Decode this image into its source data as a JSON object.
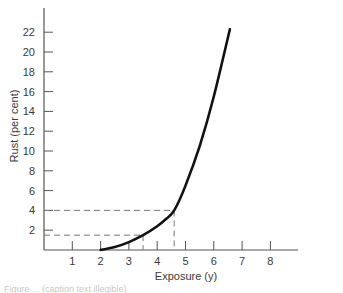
{
  "chart_data": {
    "type": "line",
    "title": "",
    "xlabel": "Exposure (y)",
    "ylabel": "Rust (per cent)",
    "xlim": [
      0,
      9
    ],
    "ylim": [
      0,
      24
    ],
    "x_ticks": [
      1,
      2,
      3,
      4,
      5,
      6,
      7,
      8
    ],
    "y_ticks": [
      2,
      4,
      6,
      8,
      10,
      12,
      14,
      16,
      18,
      20,
      22
    ],
    "grid": false,
    "legend": null,
    "series": [
      {
        "name": "Rust vs exposure",
        "x": [
          2.0,
          2.5,
          3.0,
          3.5,
          4.0,
          4.3,
          4.6,
          5.0,
          5.5,
          6.0,
          6.57
        ],
        "y": [
          0.0,
          0.3,
          0.8,
          1.5,
          2.4,
          3.1,
          4.0,
          6.5,
          10.5,
          15.5,
          22.3
        ]
      }
    ],
    "annotations": [
      {
        "type": "dashed-guide",
        "x": 3.5,
        "y": 1.5
      },
      {
        "type": "dashed-guide",
        "x": 4.6,
        "y": 4.0
      }
    ]
  },
  "caption": "Figure ... (caption text illegible)"
}
